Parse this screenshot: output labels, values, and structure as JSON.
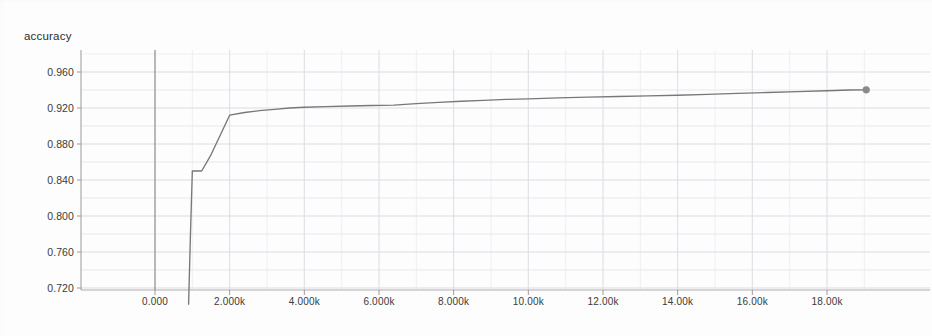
{
  "chart_data": {
    "type": "line",
    "title": "accuracy",
    "xlabel": "",
    "ylabel": "",
    "grid": true,
    "legend": null,
    "xlim": [
      -450,
      20000
    ],
    "ylim": [
      0.7,
      0.975
    ],
    "x_tick_labels": [
      "0.000",
      "2.000k",
      "4.000k",
      "6.000k",
      "8.000k",
      "10.00k",
      "12.00k",
      "14.00k",
      "16.00k",
      "18.00k"
    ],
    "x_tick_values": [
      0,
      2000,
      4000,
      6000,
      8000,
      10000,
      12000,
      14000,
      16000,
      18000
    ],
    "y_tick_labels": [
      "0.960",
      "0.920",
      "0.880",
      "0.840",
      "0.800",
      "0.760",
      "0.720"
    ],
    "y_tick_values": [
      0.96,
      0.92,
      0.88,
      0.84,
      0.8,
      0.76,
      0.72
    ],
    "series": [
      {
        "name": "accuracy",
        "color": "#787878",
        "marker_color": "#8a8a8a",
        "end_marker": true,
        "x": [
          900,
          950,
          1000,
          1250,
          1500,
          1750,
          2000,
          2400,
          2800,
          3200,
          3600,
          4000,
          4600,
          5200,
          5800,
          6400,
          7000,
          7600,
          8200,
          8800,
          9400,
          10000,
          10800,
          11600,
          12400,
          13200,
          14000,
          14800,
          15600,
          16400,
          17200,
          18000,
          18600,
          19050
        ],
        "y": [
          0.702,
          0.78,
          0.85,
          0.85,
          0.868,
          0.89,
          0.912,
          0.915,
          0.917,
          0.9185,
          0.92,
          0.9208,
          0.9215,
          0.9222,
          0.9228,
          0.9232,
          0.9248,
          0.9262,
          0.9275,
          0.9285,
          0.9295,
          0.9302,
          0.9312,
          0.932,
          0.9328,
          0.9335,
          0.9342,
          0.9352,
          0.9362,
          0.9372,
          0.9382,
          0.9392,
          0.94,
          0.9402
        ]
      }
    ],
    "annotations": []
  },
  "style": {
    "background": "#fdfdfd",
    "axis_color": "#9a9a9a",
    "origin_line_color": "#8c8c8c",
    "major_grid_color": "#d9d9e2",
    "minor_grid_color": "#e9e9f0",
    "tick_text_color": "#3a3a3a",
    "title_color": "#2b2b2b"
  }
}
